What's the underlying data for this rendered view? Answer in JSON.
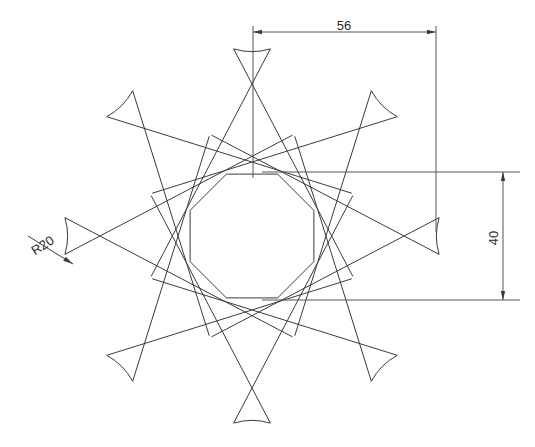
{
  "drawing": {
    "title": "8-petal rosette outline",
    "background_color": "#ffffff",
    "line_color": "#3a3a3a",
    "dimension_color": "#555555",
    "text_color": "#2b2b2b",
    "dimensions": [
      {
        "id": "width-56",
        "label": "56",
        "orientation": "horizontal",
        "value": 56,
        "label_x": 344,
        "label_y": 30,
        "line_y": 32,
        "x_start": 253,
        "x_end": 436
      },
      {
        "id": "height-40",
        "label": "40",
        "orientation": "vertical",
        "value": 40,
        "label_x": 498,
        "label_y": 238,
        "line_x": 503,
        "y_start": 172,
        "y_end": 300
      },
      {
        "id": "radius-r20",
        "label": "R20",
        "orientation": "leader",
        "value": 20,
        "prefix": "R",
        "label_x": 45,
        "label_y": 249,
        "label_rotation": -33,
        "leader_from_x": 28,
        "leader_from_y": 236,
        "leader_to_x": 73,
        "leader_to_y": 264
      }
    ],
    "geometry": {
      "petal_count": 8,
      "center_x": 252,
      "center_y": 236,
      "tip_radius": 188,
      "inner_radius": 67,
      "fillet_radius": 20,
      "rotation_offset_deg": -90,
      "skew_deg": 22,
      "half_tip_angle_deg": 5.6
    }
  }
}
